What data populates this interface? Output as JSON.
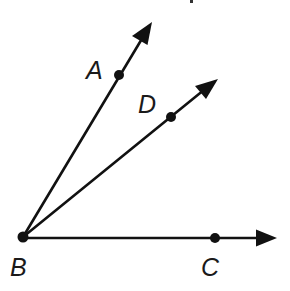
{
  "diagram": {
    "vertex": {
      "label": "B",
      "x": 23,
      "y": 237,
      "label_x": 10,
      "label_y": 276
    },
    "rays": [
      {
        "name": "ray-BA",
        "point_label": "A",
        "point": {
          "x": 119,
          "y": 75
        },
        "tip": {
          "x": 151,
          "y": 24
        },
        "label_pos": {
          "x": 86,
          "y": 79
        }
      },
      {
        "name": "ray-BD",
        "point_label": "D",
        "point": {
          "x": 171,
          "y": 117
        },
        "tip": {
          "x": 217,
          "y": 79
        },
        "label_pos": {
          "x": 138,
          "y": 113
        }
      },
      {
        "name": "ray-BC",
        "point_label": "C",
        "point": {
          "x": 215,
          "y": 238
        },
        "tip": {
          "x": 276,
          "y": 238
        },
        "label_pos": {
          "x": 201,
          "y": 276
        }
      }
    ],
    "colors": {
      "stroke": "#111111",
      "background": "#ffffff"
    }
  }
}
